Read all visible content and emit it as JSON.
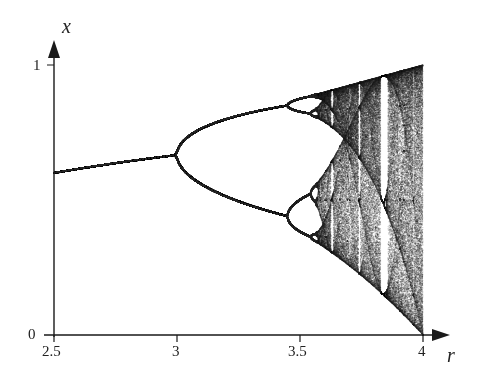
{
  "chart_data": {
    "type": "scatter",
    "title": "",
    "subtitle": "Bifurcation diagram of the logistic map x -> r x (1 - x)",
    "xlabel": "r",
    "ylabel": "x",
    "xlim": [
      2.5,
      4
    ],
    "ylim": [
      0,
      1
    ],
    "x_ticks": [
      2.5,
      3,
      3.5,
      4
    ],
    "x_tick_labels": [
      "2.5",
      "3",
      "3.5",
      "4"
    ],
    "y_ticks": [
      0,
      1
    ],
    "y_tick_labels": [
      "0",
      "1"
    ],
    "grid": false,
    "legend": null,
    "features": {
      "fixed_point_branch": {
        "r_range": [
          2.5,
          3.0
        ],
        "x_range": [
          0.6,
          0.667
        ]
      },
      "period_doubling_points": [
        3.0,
        3.449,
        3.544
      ],
      "chaos_onset": 3.57,
      "period3_window": 3.83,
      "max_x_at_r4": 1.0
    },
    "series": [
      {
        "name": "attractor x-values",
        "generator": "logistic",
        "r_start": 2.5,
        "r_end": 4.0,
        "transient": 300,
        "samples": 180
      }
    ]
  },
  "axes": {
    "x_label": "r",
    "y_label": "x",
    "x_ticks": [
      {
        "label": "2.5",
        "value": 2.5
      },
      {
        "label": "3",
        "value": 3
      },
      {
        "label": "3.5",
        "value": 3.5
      },
      {
        "label": "4",
        "value": 4
      }
    ],
    "y_ticks": [
      {
        "label": "0",
        "value": 0
      },
      {
        "label": "1",
        "value": 1
      }
    ]
  },
  "style": {
    "axis_color": "#1a1a1a",
    "point_color": "#2a2a2a",
    "background": "#ffffff"
  }
}
